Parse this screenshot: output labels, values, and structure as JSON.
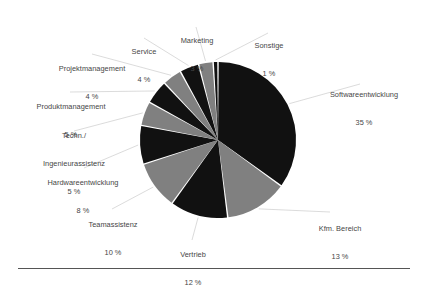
{
  "chart_data": {
    "type": "pie",
    "title": "",
    "subtitle": "",
    "xlabel": "",
    "ylabel": "",
    "legend_position": "callout-labels",
    "grid": false,
    "unit": "%",
    "total": 100,
    "start_angle_deg": 0,
    "direction": "clockwise",
    "categories": [
      "Softwareentwicklung",
      "Kfm. Bereich",
      "Vertrieb",
      "Teamassistenz",
      "Hardwareentwicklung",
      "Techn./\nIngenieurassistenz",
      "Produktmanagement",
      "Projektmanagement",
      "Service",
      "Marketing",
      "Sonstige"
    ],
    "values": [
      35,
      13,
      12,
      10,
      8,
      5,
      5,
      4,
      4,
      3,
      1
    ],
    "value_labels": [
      "35 %",
      "13 %",
      "12 %",
      "10 %",
      "8 %",
      "5 %",
      "5 %",
      "4 %",
      "4 %",
      "3 %",
      "1 %"
    ],
    "colors": [
      "#111111",
      "#808080",
      "#111111",
      "#808080",
      "#111111",
      "#808080",
      "#111111",
      "#808080",
      "#111111",
      "#808080",
      "#111111"
    ],
    "slices": [
      {
        "label": "Softwareentwicklung",
        "value": 35,
        "value_label": "35 %",
        "color": "#111111"
      },
      {
        "label": "Kfm. Bereich",
        "value": 13,
        "value_label": "13 %",
        "color": "#808080"
      },
      {
        "label": "Vertrieb",
        "value": 12,
        "value_label": "12 %",
        "color": "#111111"
      },
      {
        "label": "Teamassistenz",
        "value": 10,
        "value_label": "10 %",
        "color": "#808080"
      },
      {
        "label": "Hardwareentwicklung",
        "value": 8,
        "value_label": "8 %",
        "color": "#111111"
      },
      {
        "label": "Techn./ Ingenieurassistenz",
        "value": 5,
        "value_label": "5 %",
        "color": "#808080"
      },
      {
        "label": "Produktmanagement",
        "value": 5,
        "value_label": "5 %",
        "color": "#111111"
      },
      {
        "label": "Projektmanagement",
        "value": 4,
        "value_label": "4 %",
        "color": "#808080"
      },
      {
        "label": "Service",
        "value": 4,
        "value_label": "4 %",
        "color": "#111111"
      },
      {
        "label": "Marketing",
        "value": 3,
        "value_label": "3 %",
        "color": "#808080"
      },
      {
        "label": "Sonstige",
        "value": 1,
        "value_label": "1 %",
        "color": "#111111"
      }
    ]
  },
  "labels": {
    "softwareentwicklung": {
      "name": "Softwareentwicklung",
      "pct": "35 %"
    },
    "kfm_bereich": {
      "name": "Kfm. Bereich",
      "pct": "13 %"
    },
    "vertrieb": {
      "name": "Vertrieb",
      "pct": "12 %"
    },
    "teamassistenz": {
      "name": "Teamassistenz",
      "pct": "10 %"
    },
    "hardwareentwicklung": {
      "name": "Hardwareentwicklung",
      "pct": "8 %"
    },
    "techn_ingenieurassistenz": {
      "line1": "Techn./",
      "line2": "Ingenieurassistenz",
      "pct": "5 %"
    },
    "produktmanagement": {
      "name": "Produktmanagement",
      "pct": "5 %"
    },
    "projektmanagement": {
      "name": "Projektmanagement",
      "pct": "4 %"
    },
    "service": {
      "name": "Service",
      "pct": "4 %"
    },
    "marketing": {
      "name": "Marketing",
      "pct": "3 %"
    },
    "sonstige": {
      "name": "Sonstige",
      "pct": "1 %"
    }
  },
  "style": {
    "background": "#ffffff",
    "slice_dark": "#111111",
    "slice_gray": "#808080",
    "text_color": "#464646",
    "leader_line_color": "#d2d2d2",
    "rule_color": "#555555"
  }
}
